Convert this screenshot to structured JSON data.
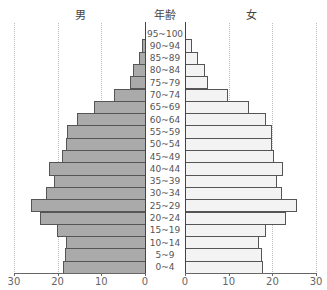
{
  "headers": {
    "male": "男",
    "age": "年齢",
    "female": "女"
  },
  "chart_data": {
    "type": "bar",
    "subtype": "population-pyramid",
    "title": "",
    "categories": [
      "95~100",
      "90~94",
      "85~89",
      "80~84",
      "75~79",
      "70~74",
      "65~69",
      "60~64",
      "55~59",
      "50~54",
      "45~49",
      "40~44",
      "35~39",
      "30~34",
      "25~29",
      "20~24",
      "15~19",
      "10~14",
      "5~9",
      "0~4"
    ],
    "series": [
      {
        "name": "男",
        "values": [
          0,
          0.7,
          1.4,
          2.7,
          3.4,
          7.1,
          11.7,
          15.6,
          17.8,
          18.1,
          19.0,
          22.0,
          20.8,
          22.7,
          26.1,
          24.0,
          20.1,
          18.1,
          18.3,
          18.8
        ],
        "color": "#aaaaaa"
      },
      {
        "name": "女",
        "values": [
          0,
          1.6,
          3.0,
          4.6,
          5.3,
          9.8,
          14.6,
          18.5,
          19.9,
          19.9,
          20.4,
          22.4,
          21.1,
          22.2,
          25.6,
          23.1,
          18.5,
          16.9,
          17.6,
          17.9
        ],
        "color": "#f3f3f3"
      }
    ],
    "xlabel": "",
    "ylabel": "年齢",
    "left_ticks": [
      "30",
      "20",
      "10",
      "0"
    ],
    "right_ticks": [
      "0",
      "10",
      "20",
      "30"
    ],
    "xlim": [
      0,
      30
    ],
    "grid": true,
    "legend": "none"
  }
}
